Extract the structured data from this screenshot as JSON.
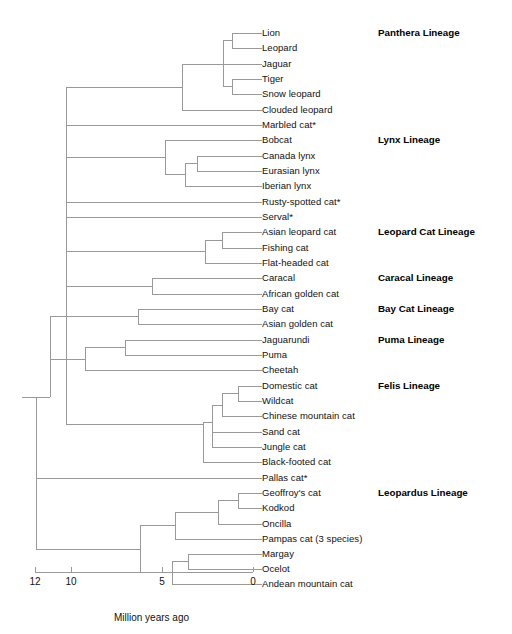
{
  "figure": {
    "type": "phylogenetic-tree",
    "title": "",
    "background_color": "#ffffff",
    "line_color": "#999999",
    "text_color": "#111111"
  },
  "taxa": [
    {
      "id": 0,
      "label": "Lion",
      "y": 33,
      "branch_x": 232
    },
    {
      "id": 1,
      "label": "Leopard",
      "y": 48,
      "branch_x": 232
    },
    {
      "id": 2,
      "label": "Jaguar",
      "y": 64,
      "branch_x": 223
    },
    {
      "id": 3,
      "label": "Tiger",
      "y": 79,
      "branch_x": 232
    },
    {
      "id": 4,
      "label": "Snow leopard",
      "y": 94,
      "branch_x": 232
    },
    {
      "id": 5,
      "label": "Clouded leopard",
      "y": 110,
      "branch_x": 182
    },
    {
      "id": 6,
      "label": "Marbled cat*",
      "y": 125,
      "branch_x": 66
    },
    {
      "id": 7,
      "label": "Bobcat",
      "y": 140,
      "branch_x": 165
    },
    {
      "id": 8,
      "label": "Canada lynx",
      "y": 156,
      "branch_x": 197
    },
    {
      "id": 9,
      "label": "Eurasian lynx",
      "y": 171,
      "branch_x": 197
    },
    {
      "id": 10,
      "label": "Iberian lynx",
      "y": 186,
      "branch_x": 185
    },
    {
      "id": 11,
      "label": "Rusty-spotted cat*",
      "y": 202,
      "branch_x": 66
    },
    {
      "id": 12,
      "label": "Serval*",
      "y": 217,
      "branch_x": 66
    },
    {
      "id": 13,
      "label": "Asian leopard cat",
      "y": 232,
      "branch_x": 222
    },
    {
      "id": 14,
      "label": "Fishing cat",
      "y": 248,
      "branch_x": 222
    },
    {
      "id": 15,
      "label": "Flat-headed cat",
      "y": 263,
      "branch_x": 205
    },
    {
      "id": 16,
      "label": "Caracal",
      "y": 278,
      "branch_x": 152
    },
    {
      "id": 17,
      "label": "African golden cat",
      "y": 294,
      "branch_x": 152
    },
    {
      "id": 18,
      "label": "Bay cat",
      "y": 309,
      "branch_x": 138
    },
    {
      "id": 19,
      "label": "Asian golden cat",
      "y": 324,
      "branch_x": 138
    },
    {
      "id": 20,
      "label": "Jaguarundi",
      "y": 340,
      "branch_x": 125
    },
    {
      "id": 21,
      "label": "Puma",
      "y": 355,
      "branch_x": 125
    },
    {
      "id": 22,
      "label": "Cheetah",
      "y": 370,
      "branch_x": 85
    },
    {
      "id": 23,
      "label": "Domestic cat",
      "y": 386,
      "branch_x": 238
    },
    {
      "id": 24,
      "label": "Wildcat",
      "y": 401,
      "branch_x": 238
    },
    {
      "id": 25,
      "label": "Chinese mountain cat",
      "y": 416,
      "branch_x": 222
    },
    {
      "id": 26,
      "label": "Sand cat",
      "y": 432,
      "branch_x": 212
    },
    {
      "id": 27,
      "label": "Jungle cat",
      "y": 447,
      "branch_x": 212
    },
    {
      "id": 28,
      "label": "Black-footed cat",
      "y": 462,
      "branch_x": 203
    },
    {
      "id": 29,
      "label": "Pallas cat*",
      "y": 478,
      "branch_x": 36
    },
    {
      "id": 30,
      "label": "Geoffroy's cat",
      "y": 493,
      "branch_x": 238
    },
    {
      "id": 31,
      "label": "Kodkod",
      "y": 508,
      "branch_x": 238
    },
    {
      "id": 32,
      "label": "Oncilla",
      "y": 524,
      "branch_x": 218
    },
    {
      "id": 33,
      "label": "Pampas cat (3 species)",
      "y": 539,
      "branch_x": 175
    },
    {
      "id": 34,
      "label": "Margay",
      "y": 554,
      "branch_x": 188
    },
    {
      "id": 35,
      "label": "Ocelot",
      "y": 569,
      "branch_x": 188
    },
    {
      "id": 36,
      "label": "Andean mountain cat",
      "y": 584,
      "branch_x": 172
    }
  ],
  "label_x": 262,
  "lineages": [
    {
      "label": "Panthera Lineage",
      "y": 33,
      "x": 378
    },
    {
      "label": "Lynx Lineage",
      "y": 140,
      "x": 378
    },
    {
      "label": "Leopard Cat Lineage",
      "y": 232,
      "x": 378
    },
    {
      "label": "Caracal Lineage",
      "y": 278,
      "x": 378
    },
    {
      "label": "Bay Cat Lineage",
      "y": 309,
      "x": 378
    },
    {
      "label": "Puma Lineage",
      "y": 340,
      "x": 378
    },
    {
      "label": "Felis Lineage",
      "y": 386,
      "x": 378
    },
    {
      "label": "Leopardus Lineage",
      "y": 493,
      "x": 378
    }
  ],
  "axis": {
    "title": "Million years ago",
    "title_x": 114,
    "title_y": 613,
    "line_y": 572,
    "x_min": 35,
    "x_max": 253,
    "ticks": [
      {
        "value": "12",
        "x": 35
      },
      {
        "value": "10",
        "x": 71
      },
      {
        "value": "5",
        "x": 162
      },
      {
        "value": "0",
        "x": 253
      }
    ]
  },
  "chart_data": {
    "type": "tree",
    "xlabel": "Million years ago",
    "xlim": [
      12,
      0
    ],
    "grid": false,
    "legend": "none",
    "note": "Asterisk (*) marks taxa whose lineage placement is singular/monotypic on the backbone.",
    "n_taxa": 37,
    "lineage_groups": [
      {
        "name": "Panthera Lineage",
        "members": [
          "Lion",
          "Leopard",
          "Jaguar",
          "Tiger",
          "Snow leopard",
          "Clouded leopard"
        ],
        "divergence_mya": 10.8
      },
      {
        "name": "Lynx Lineage",
        "members": [
          "Bobcat",
          "Canada lynx",
          "Eurasian lynx",
          "Iberian lynx"
        ],
        "divergence_mya": 7.2
      },
      {
        "name": "Leopard Cat Lineage",
        "members": [
          "Asian leopard cat",
          "Fishing cat",
          "Flat-headed cat"
        ],
        "divergence_mya": 6.2
      },
      {
        "name": "Caracal Lineage",
        "members": [
          "Caracal",
          "African golden cat"
        ],
        "divergence_mya": 5.6
      },
      {
        "name": "Bay Cat Lineage",
        "members": [
          "Bay cat",
          "Asian golden cat"
        ],
        "divergence_mya": 6.3
      },
      {
        "name": "Puma Lineage",
        "members": [
          "Jaguarundi",
          "Puma",
          "Cheetah"
        ],
        "divergence_mya": 9.2
      },
      {
        "name": "Felis Lineage",
        "members": [
          "Domestic cat",
          "Wildcat",
          "Chinese mountain cat",
          "Sand cat",
          "Jungle cat",
          "Black-footed cat"
        ],
        "divergence_mya": 2.8
      },
      {
        "name": "Leopardus Lineage",
        "members": [
          "Geoffroy's cat",
          "Kodkod",
          "Oncilla",
          "Pampas cat (3 species)",
          "Margay",
          "Ocelot",
          "Andean mountain cat"
        ],
        "divergence_mya": 4.5
      }
    ],
    "unplaced_taxa": [
      "Marbled cat*",
      "Rusty-spotted cat*",
      "Serval*",
      "Pallas cat*"
    ]
  },
  "edges": {
    "horizontal": [
      {
        "name": "root-stub",
        "x1": 22,
        "x2": 36,
        "y": 397
      },
      {
        "name": "h-lion",
        "x1": 232,
        "x2": 262,
        "y": 33
      },
      {
        "name": "h-leopard",
        "x1": 232,
        "x2": 262,
        "y": 48
      },
      {
        "name": "h-jaguar",
        "x1": 223,
        "x2": 262,
        "y": 64
      },
      {
        "name": "h-tiger",
        "x1": 232,
        "x2": 262,
        "y": 79
      },
      {
        "name": "h-snowleopard",
        "x1": 232,
        "x2": 262,
        "y": 94
      },
      {
        "name": "h-cloudedleopard",
        "x1": 182,
        "x2": 262,
        "y": 110
      },
      {
        "name": "h-marbledcat",
        "x1": 66,
        "x2": 262,
        "y": 125
      },
      {
        "name": "h-bobcat",
        "x1": 165,
        "x2": 262,
        "y": 140
      },
      {
        "name": "h-canadalynx",
        "x1": 197,
        "x2": 262,
        "y": 156
      },
      {
        "name": "h-eurasianlynx",
        "x1": 197,
        "x2": 262,
        "y": 171
      },
      {
        "name": "h-iberianlynx",
        "x1": 185,
        "x2": 262,
        "y": 186
      },
      {
        "name": "h-rustyspotted",
        "x1": 66,
        "x2": 262,
        "y": 202
      },
      {
        "name": "h-serval",
        "x1": 66,
        "x2": 262,
        "y": 217
      },
      {
        "name": "h-asianleopardcat",
        "x1": 222,
        "x2": 262,
        "y": 232
      },
      {
        "name": "h-fishingcat",
        "x1": 222,
        "x2": 262,
        "y": 248
      },
      {
        "name": "h-flatheadedcat",
        "x1": 205,
        "x2": 262,
        "y": 263
      },
      {
        "name": "h-caracal",
        "x1": 152,
        "x2": 262,
        "y": 278
      },
      {
        "name": "h-africangolden",
        "x1": 152,
        "x2": 262,
        "y": 294
      },
      {
        "name": "h-baycat",
        "x1": 138,
        "x2": 262,
        "y": 309
      },
      {
        "name": "h-asiangolden",
        "x1": 138,
        "x2": 262,
        "y": 324
      },
      {
        "name": "h-jaguarundi",
        "x1": 125,
        "x2": 262,
        "y": 340
      },
      {
        "name": "h-puma",
        "x1": 125,
        "x2": 262,
        "y": 355
      },
      {
        "name": "h-cheetah",
        "x1": 85,
        "x2": 262,
        "y": 370
      },
      {
        "name": "h-domesticcat",
        "x1": 238,
        "x2": 262,
        "y": 386
      },
      {
        "name": "h-wildcat",
        "x1": 238,
        "x2": 262,
        "y": 401
      },
      {
        "name": "h-chinesemountain",
        "x1": 222,
        "x2": 262,
        "y": 416
      },
      {
        "name": "h-sandcat",
        "x1": 212,
        "x2": 262,
        "y": 432
      },
      {
        "name": "h-junglecat",
        "x1": 212,
        "x2": 262,
        "y": 447
      },
      {
        "name": "h-blackfooted",
        "x1": 203,
        "x2": 262,
        "y": 462
      },
      {
        "name": "h-pallascat",
        "x1": 36,
        "x2": 262,
        "y": 478
      },
      {
        "name": "h-geoffroys",
        "x1": 238,
        "x2": 262,
        "y": 493
      },
      {
        "name": "h-kodkod",
        "x1": 238,
        "x2": 262,
        "y": 508
      },
      {
        "name": "h-oncilla",
        "x1": 218,
        "x2": 262,
        "y": 524
      },
      {
        "name": "h-pampascat",
        "x1": 175,
        "x2": 262,
        "y": 539
      },
      {
        "name": "h-margay",
        "x1": 188,
        "x2": 262,
        "y": 554
      },
      {
        "name": "h-ocelot",
        "x1": 188,
        "x2": 262,
        "y": 569
      },
      {
        "name": "h-andeanmountain",
        "x1": 172,
        "x2": 262,
        "y": 584
      },
      {
        "name": "h-node-lionleopard",
        "x1": 223,
        "x2": 232,
        "y": 40.5
      },
      {
        "name": "h-node-tigersnow",
        "x1": 223,
        "x2": 232,
        "y": 86.5
      },
      {
        "name": "h-node-panthera",
        "x1": 182,
        "x2": 223,
        "y": 64
      },
      {
        "name": "h-node-pantheraclade",
        "x1": 66,
        "x2": 182,
        "y": 87
      },
      {
        "name": "h-node-canadaeurasian",
        "x1": 185,
        "x2": 197,
        "y": 163.5
      },
      {
        "name": "h-node-lynx3",
        "x1": 165,
        "x2": 185,
        "y": 174.5
      },
      {
        "name": "h-node-lynxclade",
        "x1": 66,
        "x2": 165,
        "y": 157
      },
      {
        "name": "h-node-alcfishing",
        "x1": 205,
        "x2": 222,
        "y": 240
      },
      {
        "name": "h-node-leopardcat",
        "x1": 66,
        "x2": 205,
        "y": 251.5
      },
      {
        "name": "h-node-caracal",
        "x1": 66,
        "x2": 152,
        "y": 286
      },
      {
        "name": "h-node-baycat",
        "x1": 50,
        "x2": 138,
        "y": 316.5
      },
      {
        "name": "h-node-jagpuma",
        "x1": 85,
        "x2": 125,
        "y": 347.5
      },
      {
        "name": "h-node-puma",
        "x1": 50,
        "x2": 85,
        "y": 359
      },
      {
        "name": "h-node-domwild",
        "x1": 222,
        "x2": 238,
        "y": 393.5
      },
      {
        "name": "h-node-felis3",
        "x1": 212,
        "x2": 222,
        "y": 405
      },
      {
        "name": "h-node-sandjungle",
        "x1": 212,
        "x2": 212,
        "y": 439.5
      },
      {
        "name": "h-node-felis5",
        "x1": 203,
        "x2": 212,
        "y": 422
      },
      {
        "name": "h-node-felisclade",
        "x1": 66,
        "x2": 203,
        "y": 424
      },
      {
        "name": "h-node-geoffkodkod",
        "x1": 218,
        "x2": 238,
        "y": 500.5
      },
      {
        "name": "h-node-leop3",
        "x1": 175,
        "x2": 218,
        "y": 512
      },
      {
        "name": "h-node-leop4",
        "x1": 140,
        "x2": 175,
        "y": 525.5
      },
      {
        "name": "h-node-margayocelot",
        "x1": 172,
        "x2": 188,
        "y": 561.5
      },
      {
        "name": "h-node-leop-andean",
        "x1": 140,
        "x2": 172,
        "y": 572.8
      },
      {
        "name": "h-node-leopardus",
        "x1": 36,
        "x2": 140,
        "y": 549
      },
      {
        "name": "h-node-backbone-mid",
        "x1": 36,
        "x2": 50,
        "y": 397
      }
    ],
    "vertical": [
      {
        "name": "v-lionleopard",
        "x": 232,
        "y1": 33,
        "y2": 48
      },
      {
        "name": "v-tigersnow",
        "x": 232,
        "y1": 79,
        "y2": 94
      },
      {
        "name": "v-panthera-core",
        "x": 223,
        "y1": 40.5,
        "y2": 86.5
      },
      {
        "name": "v-panthera",
        "x": 182,
        "y1": 64,
        "y2": 110
      },
      {
        "name": "v-canadaeurasian",
        "x": 197,
        "y1": 156,
        "y2": 171
      },
      {
        "name": "v-lynx3",
        "x": 185,
        "y1": 163.5,
        "y2": 186
      },
      {
        "name": "v-lynxclade",
        "x": 165,
        "y1": 140,
        "y2": 174.5
      },
      {
        "name": "v-alcfishing",
        "x": 222,
        "y1": 232,
        "y2": 248
      },
      {
        "name": "v-leopardcat",
        "x": 205,
        "y1": 240,
        "y2": 263
      },
      {
        "name": "v-caracal",
        "x": 152,
        "y1": 278,
        "y2": 294
      },
      {
        "name": "v-baycat",
        "x": 138,
        "y1": 309,
        "y2": 324
      },
      {
        "name": "v-jagpuma",
        "x": 125,
        "y1": 340,
        "y2": 355
      },
      {
        "name": "v-pumaclade",
        "x": 85,
        "y1": 347.5,
        "y2": 370
      },
      {
        "name": "v-domwild",
        "x": 238,
        "y1": 386,
        "y2": 401
      },
      {
        "name": "v-felis3",
        "x": 222,
        "y1": 393.5,
        "y2": 416
      },
      {
        "name": "v-sandjungle",
        "x": 212,
        "y1": 405,
        "y2": 447
      },
      {
        "name": "v-felisclade",
        "x": 203,
        "y1": 422,
        "y2": 462
      },
      {
        "name": "v-geoffkodkod",
        "x": 238,
        "y1": 493,
        "y2": 508
      },
      {
        "name": "v-leop3",
        "x": 218,
        "y1": 500.5,
        "y2": 524
      },
      {
        "name": "v-leop4",
        "x": 175,
        "y1": 512,
        "y2": 539
      },
      {
        "name": "v-margayocelot",
        "x": 188,
        "y1": 554,
        "y2": 569
      },
      {
        "name": "v-leop-andean",
        "x": 172,
        "y1": 561.5,
        "y2": 584
      },
      {
        "name": "v-leopardus",
        "x": 140,
        "y1": 525.5,
        "y2": 572.8
      },
      {
        "name": "v-backbone-main",
        "x": 66,
        "y1": 87,
        "y2": 424
      },
      {
        "name": "v-backbone-mid",
        "x": 50,
        "y1": 316.5,
        "y2": 397
      },
      {
        "name": "v-root",
        "x": 36,
        "y1": 397,
        "y2": 549
      },
      {
        "name": "v-root-pallas",
        "x": 36,
        "y1": 478,
        "y2": 478
      }
    ]
  }
}
